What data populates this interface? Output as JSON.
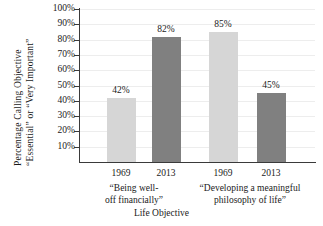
{
  "chart_data": {
    "type": "bar",
    "title": "",
    "xlabel": "Life Objective",
    "ylabel_line1": "Percentage Calling Objective",
    "ylabel_line2": "“Essential” or “Very Important”",
    "ylim": [
      0,
      100
    ],
    "yticks": [
      "10%",
      "20%",
      "30%",
      "40%",
      "50%",
      "60%",
      "70%",
      "80%",
      "90%",
      "100%"
    ],
    "ytick_values": [
      10,
      20,
      30,
      40,
      50,
      60,
      70,
      80,
      90,
      100
    ],
    "grid": true,
    "legend": "none",
    "categories": [
      "1969",
      "2013",
      "1969",
      "2013"
    ],
    "values": [
      42,
      85,
      82,
      45
    ],
    "bars": [
      {
        "group": "“Being well-off financially”",
        "year": "1969",
        "value": 42,
        "label": "42%",
        "color": "#d6d6d6"
      },
      {
        "group": "“Being well-off financially”",
        "year": "2013",
        "value": 82,
        "label": "82%",
        "color": "#808080"
      },
      {
        "group": "“Developing a meaningful philosophy of life”",
        "year": "1969",
        "value": 85,
        "label": "85%",
        "color": "#d6d6d6"
      },
      {
        "group": "“Developing a meaningful philosophy of life”",
        "year": "2013",
        "value": 45,
        "label": "45%",
        "color": "#808080"
      }
    ],
    "groups": [
      {
        "line1": "“Being well-",
        "line2": "off financially”"
      },
      {
        "line1": "“Developing a meaningful",
        "line2": "philosophy of life”"
      }
    ],
    "colors": {
      "bar_1969": "#d6d6d6",
      "bar_2013": "#808080",
      "axis": "#3a3a3a",
      "gridline": "#ededed",
      "text": "#1a1a1a",
      "background": "#ffffff"
    }
  }
}
